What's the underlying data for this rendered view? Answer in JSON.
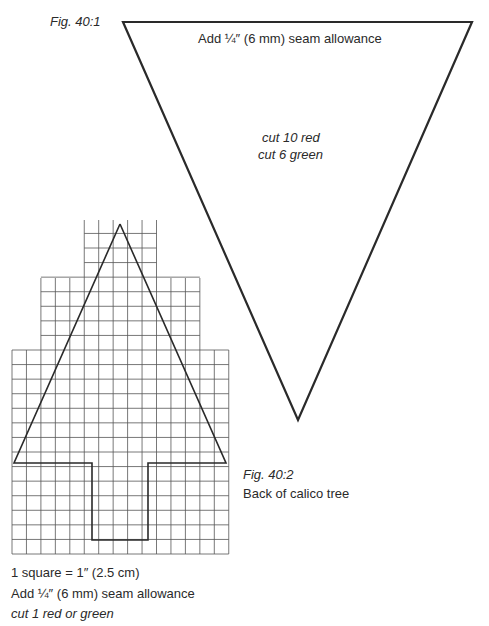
{
  "figure1": {
    "label": "Fig. 40:1",
    "seam_note": "Add ¼″ (6 mm) seam allowance",
    "cut_line1": "cut 10 red",
    "cut_line2": "cut 6 green",
    "shape": "triangle-pennant"
  },
  "figure2": {
    "label": "Fig. 40:2",
    "title": "Back of calico tree",
    "scale_note": "1 square = 1″ (2.5 cm)",
    "seam_note": "Add ¼″ (6 mm) seam allowance",
    "cut_note": "cut 1 red or green",
    "shape": "tree-on-grid"
  },
  "colors": {
    "line": "#2a2a2a",
    "grid": "#555555",
    "background": "#ffffff"
  }
}
